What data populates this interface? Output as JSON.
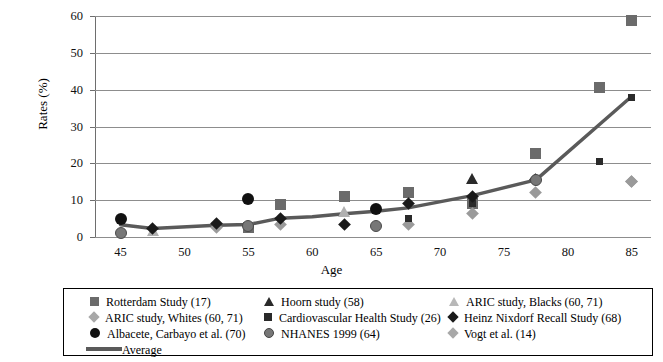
{
  "chart_data": {
    "type": "scatter",
    "title": "",
    "xlabel": "Age",
    "ylabel": "Rates (%)",
    "xlim": [
      43,
      86.5
    ],
    "ylim": [
      0,
      60
    ],
    "xticks": [
      45,
      50,
      55,
      60,
      65,
      70,
      75,
      80,
      85
    ],
    "yticks": [
      0,
      10,
      20,
      30,
      40,
      50,
      60
    ],
    "grid": "horizontal",
    "legend_position": "bottom",
    "series": [
      {
        "name": "Rotterdam Study (17)",
        "marker": "square",
        "color": "#6b6b6b",
        "points": [
          [
            55,
            2.5
          ],
          [
            57.5,
            8.7
          ],
          [
            62.5,
            11.0
          ],
          [
            67.5,
            12.0
          ],
          [
            72.5,
            9.0
          ],
          [
            77.5,
            22.6
          ],
          [
            82.5,
            40.6
          ],
          [
            85,
            58.8
          ]
        ]
      },
      {
        "name": "Hoorn study (58)",
        "marker": "triangle",
        "color": "#2a2a2a",
        "points": [
          [
            72.5,
            16.0
          ]
        ]
      },
      {
        "name": "ARIC study, Blacks (60, 71)",
        "marker": "triangle-light",
        "color": "#b0b0b0",
        "points": [
          [
            47.5,
            1.8
          ],
          [
            62.5,
            7.0
          ]
        ]
      },
      {
        "name": "ARIC study, Whites (60, 71)",
        "marker": "diamond-light",
        "color": "#9a9a9a",
        "points": [
          [
            52.5,
            2.6
          ],
          [
            57.5,
            3.3
          ],
          [
            67.5,
            3.4
          ],
          [
            72.5,
            6.5
          ],
          [
            77.5,
            12.0
          ],
          [
            85,
            15.0
          ]
        ]
      },
      {
        "name": "Cardiovascular Health Study (26)",
        "marker": "square-small",
        "color": "#2a2a2a",
        "points": [
          [
            67.5,
            5.0
          ],
          [
            72.5,
            9.0
          ],
          [
            82.5,
            20.6
          ],
          [
            85,
            38.0
          ]
        ]
      },
      {
        "name": "Heinz Nixdorf Recall Study (68)",
        "marker": "diamond",
        "color": "#1a1a1a",
        "points": [
          [
            47.5,
            2.4
          ],
          [
            52.5,
            3.7
          ],
          [
            57.5,
            5.0
          ],
          [
            62.5,
            3.5
          ],
          [
            67.5,
            9.0
          ],
          [
            72.5,
            11.0
          ],
          [
            77.5,
            15.6
          ]
        ]
      },
      {
        "name": "Albacete, Carbayo et al. (70)",
        "marker": "circle",
        "color": "#111111",
        "points": [
          [
            45,
            5.0
          ],
          [
            55,
            10.3
          ],
          [
            65,
            7.5
          ]
        ]
      },
      {
        "name": "NHANES 1999 (64)",
        "marker": "circle-gray",
        "color": "#777777",
        "points": [
          [
            45,
            1.2
          ],
          [
            55,
            3.0
          ],
          [
            65,
            3.0
          ],
          [
            77.5,
            15.5
          ]
        ]
      },
      {
        "name": "Vogt et al. (14)",
        "marker": "diamond-light",
        "color": "#9a9a9a",
        "points": [
          [
            85,
            15.0
          ]
        ]
      }
    ],
    "average_line": {
      "name": "Average",
      "color": "#5a5a5a",
      "points": [
        [
          45,
          3.3
        ],
        [
          47.5,
          2.3
        ],
        [
          52.5,
          3.2
        ],
        [
          55,
          3.4
        ],
        [
          57.5,
          5.1
        ],
        [
          60,
          5.5
        ],
        [
          62.5,
          6.3
        ],
        [
          65,
          7.0
        ],
        [
          67.5,
          7.9
        ],
        [
          72.5,
          11.2
        ],
        [
          77.5,
          15.5
        ],
        [
          85,
          38.2
        ]
      ]
    }
  },
  "axis": {
    "ylabel": "Rates (%)",
    "xlabel": "Age",
    "yticks": [
      "0",
      "10",
      "20",
      "30",
      "40",
      "50",
      "60"
    ],
    "xticks": [
      "45",
      "50",
      "55",
      "60",
      "65",
      "70",
      "75",
      "80",
      "85"
    ]
  },
  "legend": {
    "col1": [
      {
        "label": "Rotterdam Study (17)",
        "icon": "square-marker-icon"
      },
      {
        "label": "ARIC study, Whites (60, 71)",
        "icon": "diamond-light-marker-icon"
      },
      {
        "label": "Albacete, Carbayo et al. (70)",
        "icon": "circle-marker-icon"
      }
    ],
    "col2": [
      {
        "label": "Hoorn study (58)",
        "icon": "triangle-marker-icon"
      },
      {
        "label": "Cardiovascular Health Study (26)",
        "icon": "square-small-marker-icon"
      },
      {
        "label": "NHANES 1999 (64)",
        "icon": "circle-gray-marker-icon"
      }
    ],
    "col3": [
      {
        "label": "ARIC study, Blacks (60, 71)",
        "icon": "triangle-light-marker-icon"
      },
      {
        "label": "Heinz Nixdorf Recall Study (68)",
        "icon": "diamond-marker-icon"
      },
      {
        "label": "Vogt et al. (14)",
        "icon": "diamond-light-marker-icon"
      }
    ],
    "average": {
      "label": "Average",
      "icon": "line-marker-icon"
    }
  }
}
